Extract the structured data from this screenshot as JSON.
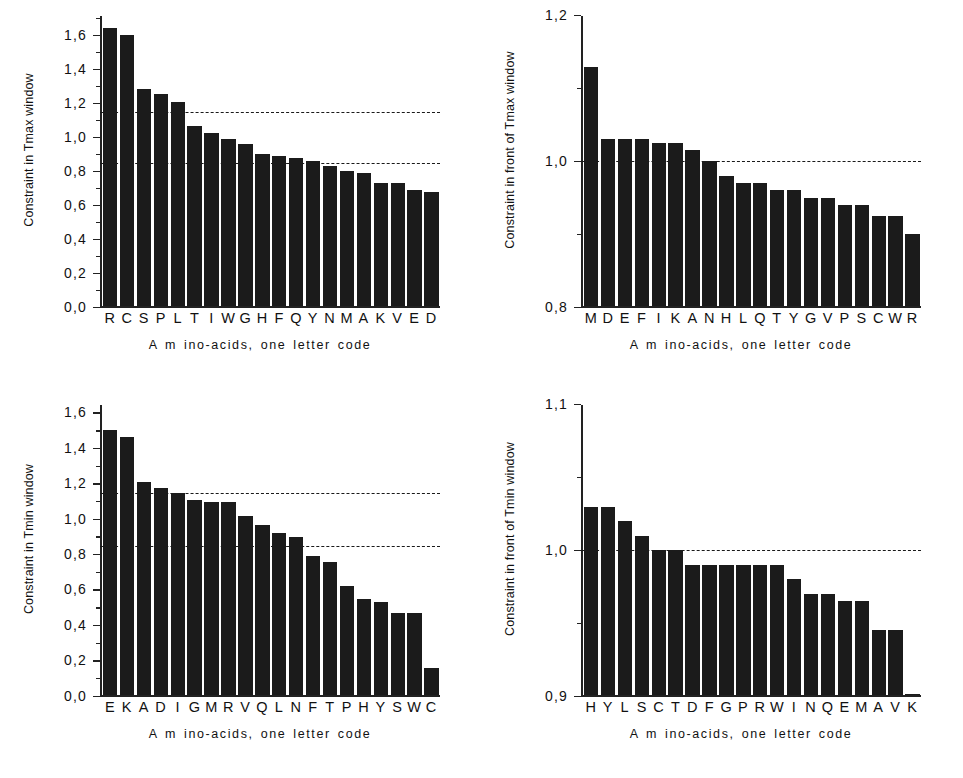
{
  "figure": {
    "xlabel_common": "A m ino-acids, one letter code"
  },
  "chart_data": [
    {
      "id": "tmax-window",
      "position": "top-left",
      "type": "bar",
      "title": "",
      "ylabel": "Constraint in Tmax window",
      "xlabel": "A m ino-acids, one letter code",
      "ylim": [
        0.0,
        1.72
      ],
      "yticks": [
        0.0,
        0.2,
        0.4,
        0.6,
        0.8,
        1.0,
        1.2,
        1.4,
        1.6
      ],
      "ytick_labels": [
        "0,0",
        "0,2",
        "0,4",
        "0,6",
        "0,8",
        "1,0",
        "1,2",
        "1,4",
        "1,6"
      ],
      "grid": false,
      "reference_lines": [
        1.15,
        0.85
      ],
      "categories": [
        "R",
        "C",
        "S",
        "P",
        "L",
        "T",
        "I",
        "W",
        "G",
        "H",
        "F",
        "Q",
        "Y",
        "N",
        "M",
        "A",
        "K",
        "V",
        "E",
        "D"
      ],
      "values": [
        1.65,
        1.61,
        1.29,
        1.26,
        1.21,
        1.07,
        1.03,
        0.99,
        0.96,
        0.9,
        0.89,
        0.88,
        0.86,
        0.83,
        0.8,
        0.79,
        0.73,
        0.73,
        0.69,
        0.68
      ]
    },
    {
      "id": "front-of-tmax-window",
      "position": "top-right",
      "type": "bar",
      "title": "",
      "ylabel": "Constraint in front of Tmax window",
      "xlabel": "A m ino-acids, one letter code",
      "ylim": [
        0.8,
        1.2
      ],
      "yticks": [
        0.8,
        1.0,
        1.2
      ],
      "ytick_labels": [
        "0,8",
        "1,0",
        "1,2"
      ],
      "yminor_ticks": [
        0.9,
        1.1
      ],
      "grid": false,
      "reference_lines": [
        1.0
      ],
      "categories": [
        "M",
        "D",
        "E",
        "F",
        "I",
        "K",
        "A",
        "N",
        "H",
        "L",
        "Q",
        "T",
        "Y",
        "G",
        "V",
        "P",
        "S",
        "C",
        "W",
        "R"
      ],
      "values": [
        1.13,
        1.03,
        1.03,
        1.03,
        1.025,
        1.025,
        1.015,
        1.0,
        0.98,
        0.97,
        0.97,
        0.96,
        0.96,
        0.95,
        0.95,
        0.94,
        0.94,
        0.925,
        0.925,
        0.9
      ]
    },
    {
      "id": "tmin-window",
      "position": "bottom-left",
      "type": "bar",
      "title": "",
      "ylabel": "Constraint in Tmin window",
      "xlabel": "A m ino-acids, one letter code",
      "ylim": [
        0.0,
        1.65
      ],
      "yticks": [
        0.0,
        0.2,
        0.4,
        0.6,
        0.8,
        1.0,
        1.2,
        1.4,
        1.6
      ],
      "ytick_labels": [
        "0,0",
        "0,2",
        "0,4",
        "0,6",
        "0,8",
        "1,0",
        "1,2",
        "1,4",
        "1,6"
      ],
      "grid": false,
      "reference_lines": [
        1.15,
        0.85
      ],
      "categories": [
        "E",
        "K",
        "A",
        "D",
        "I",
        "G",
        "M",
        "R",
        "V",
        "Q",
        "L",
        "N",
        "F",
        "T",
        "P",
        "H",
        "Y",
        "S",
        "W",
        "C"
      ],
      "values": [
        1.51,
        1.47,
        1.21,
        1.18,
        1.15,
        1.11,
        1.1,
        1.1,
        1.02,
        0.97,
        0.92,
        0.9,
        0.79,
        0.76,
        0.62,
        0.55,
        0.53,
        0.47,
        0.47,
        0.155
      ]
    },
    {
      "id": "front-of-tmin-window",
      "position": "bottom-right",
      "type": "bar",
      "title": "",
      "ylabel": "Constraint in front of Tmin window",
      "xlabel": "A m ino-acids, one letter code",
      "ylim": [
        0.9,
        1.1
      ],
      "yticks": [
        0.9,
        1.0,
        1.1
      ],
      "ytick_labels": [
        "0,9",
        "1,0",
        "1,1"
      ],
      "yminor_ticks": [
        0.95,
        1.05
      ],
      "grid": false,
      "reference_lines": [
        1.0
      ],
      "categories": [
        "H",
        "Y",
        "L",
        "S",
        "C",
        "T",
        "D",
        "F",
        "G",
        "P",
        "R",
        "W",
        "I",
        "N",
        "Q",
        "E",
        "M",
        "A",
        "V",
        "K"
      ],
      "values": [
        1.03,
        1.03,
        1.02,
        1.01,
        1.0,
        1.0,
        0.99,
        0.99,
        0.99,
        0.99,
        0.99,
        0.99,
        0.98,
        0.97,
        0.97,
        0.965,
        0.965,
        0.945,
        0.945,
        0.901
      ]
    }
  ],
  "colors": {
    "bar": "#1b1b1b",
    "axis": "#222222",
    "reference_line": "#1a1a1a",
    "background": "#ffffff"
  }
}
